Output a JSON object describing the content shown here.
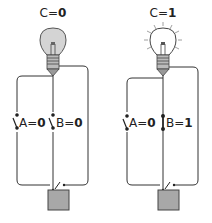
{
  "circuits": [
    {
      "id": "left",
      "output_label": "C=",
      "output_value": "0",
      "bulb_state": "off",
      "switches": [
        {
          "name": "A",
          "label": "A=",
          "value": "0",
          "state": "open"
        },
        {
          "name": "B",
          "label": "B=",
          "value": "0",
          "state": "open"
        }
      ]
    },
    {
      "id": "right",
      "output_label": "C=",
      "output_value": "1",
      "bulb_state": "on",
      "switches": [
        {
          "name": "A",
          "label": "A=",
          "value": "0",
          "state": "open"
        },
        {
          "name": "B",
          "label": "B=",
          "value": "1",
          "state": "closed"
        }
      ]
    }
  ],
  "colors": {
    "wire": "#333333",
    "bulb_off_fill": "#d4d4d4",
    "bulb_on_fill": "#ffffff",
    "battery_fill": "#a8a8a8"
  }
}
